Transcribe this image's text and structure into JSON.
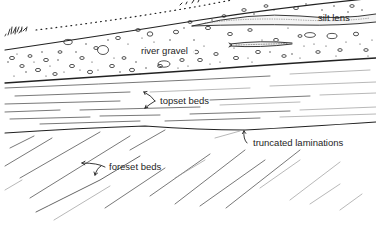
{
  "figure": {
    "background": "#ffffff",
    "ink_color": "#222222",
    "labels": {
      "silt_lens": "silt lens",
      "river_gravel": "river gravel",
      "topset_beds": "topset beds",
      "truncated_laminations": "truncated laminations",
      "foreset_beds": "foreset beds"
    },
    "units": [
      {
        "name": "vegetation",
        "description": "grass tufts at the left ground surface"
      },
      {
        "name": "ground-surface",
        "description": "dotted line rising to upper right"
      },
      {
        "name": "river-gravel",
        "description": "pebble-filled wedge thickening to the right"
      },
      {
        "name": "silt-lens",
        "description": "thin stippled lenses within the gravel"
      },
      {
        "name": "topset-beds",
        "description": "near-horizontal laminations below the gravel"
      },
      {
        "name": "truncation-surface",
        "description": "erosional surface cutting foreset tops"
      },
      {
        "name": "foreset-beds",
        "description": "inclined laminations dipping to the lower left"
      }
    ]
  }
}
